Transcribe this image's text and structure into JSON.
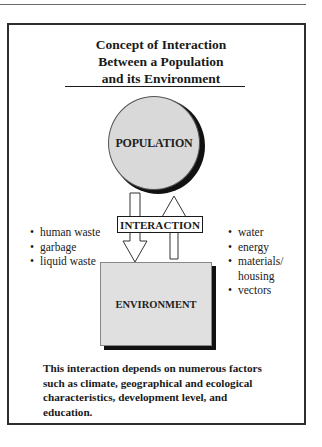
{
  "title": {
    "lines": [
      "Concept of Interaction",
      "Between a Population",
      "and its Environment"
    ]
  },
  "population": {
    "label": "POPULATION",
    "fill": "#d9d9d9"
  },
  "interaction": {
    "label": "INTERACTION"
  },
  "environment": {
    "label": "ENVIRONMENT",
    "fill": "#e0e0e0"
  },
  "outputs_to_environment": {
    "bullet": "•",
    "items": [
      "human waste",
      "garbage",
      "liquid waste"
    ]
  },
  "inputs_from_environment": {
    "bullet": "•",
    "items": [
      "water",
      "energy",
      "materials/",
      "housing",
      "vectors"
    ]
  },
  "caption": {
    "lines": [
      "This interaction depends on numerous factors",
      "such as climate, geographical and ecological",
      "characteristics, development level, and",
      "education."
    ]
  }
}
